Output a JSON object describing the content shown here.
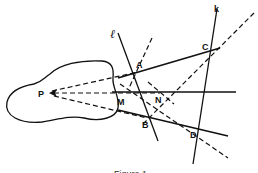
{
  "figure": {
    "caption": "Figure 1",
    "region_shape": "irregular-blob",
    "points": {
      "P": {
        "label": "P",
        "x": 48,
        "y": 93
      },
      "A": {
        "label": "A",
        "x": 138,
        "y": 72
      },
      "B": {
        "label": "B",
        "x": 147,
        "y": 118
      },
      "C": {
        "label": "C",
        "x": 208,
        "y": 50
      },
      "D": {
        "label": "D",
        "x": 199,
        "y": 130
      },
      "M": {
        "label": "M",
        "x": 124,
        "y": 100
      },
      "N": {
        "label": "N",
        "x": 160,
        "y": 93
      }
    },
    "lines": {
      "l": {
        "label": "ℓ"
      },
      "k": {
        "label": "k"
      }
    },
    "colors": {
      "ink": "#111111",
      "background": "#ffffff"
    }
  }
}
